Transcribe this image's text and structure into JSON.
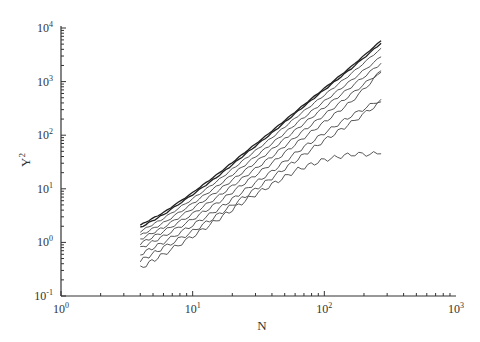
{
  "chart_data": {
    "type": "line",
    "title": "",
    "xlabel": "N",
    "ylabel": "Y^2",
    "xscale": "log",
    "yscale": "log",
    "xlim": [
      1,
      1000
    ],
    "ylim": [
      0.1,
      10000
    ],
    "grid": false,
    "legend": null,
    "x_ticks": [
      {
        "value": 1,
        "base": "10",
        "exp": "0"
      },
      {
        "value": 10,
        "base": "10",
        "exp": "1"
      },
      {
        "value": 100,
        "base": "10",
        "exp": "2"
      },
      {
        "value": 1000,
        "base": "10",
        "exp": "3"
      }
    ],
    "y_ticks": [
      {
        "value": 0.1,
        "base": "10",
        "exp": "-1"
      },
      {
        "value": 1,
        "base": "10",
        "exp": "0"
      },
      {
        "value": 10,
        "base": "10",
        "exp": "1"
      },
      {
        "value": 100,
        "base": "10",
        "exp": "2"
      },
      {
        "value": 1000,
        "base": "10",
        "exp": "3"
      },
      {
        "value": 10000,
        "base": "10",
        "exp": "4"
      }
    ],
    "x": [
      4,
      6,
      10,
      16,
      25,
      40,
      63,
      100,
      160,
      270
    ],
    "series": [
      {
        "name": "curve-1",
        "values": [
          2.1,
          3.6,
          8.5,
          20,
          48,
          120,
          300,
          750,
          1900,
          5800
        ]
      },
      {
        "name": "curve-2",
        "values": [
          1.9,
          3.3,
          7.8,
          18,
          44,
          110,
          280,
          700,
          1750,
          5200
        ]
      },
      {
        "name": "curve-3",
        "values": [
          1.6,
          2.8,
          6.5,
          15,
          36,
          90,
          230,
          560,
          1400,
          4200
        ]
      },
      {
        "name": "curve-4",
        "values": [
          1.35,
          2.3,
          5.3,
          12,
          28,
          70,
          175,
          430,
          1050,
          2900
        ]
      },
      {
        "name": "curve-5",
        "values": [
          1.15,
          1.9,
          4.3,
          9.6,
          22,
          54,
          135,
          330,
          800,
          2200
        ]
      },
      {
        "name": "curve-6",
        "values": [
          0.95,
          1.6,
          3.4,
          7.5,
          17,
          40,
          100,
          240,
          580,
          1600
        ]
      },
      {
        "name": "curve-7",
        "values": [
          0.78,
          1.3,
          2.7,
          5.8,
          13,
          30,
          74,
          175,
          420,
          1500
        ]
      },
      {
        "name": "curve-8",
        "values": [
          0.6,
          1.0,
          2.1,
          4.3,
          9.5,
          21,
          50,
          110,
          230,
          470
        ]
      },
      {
        "name": "curve-9",
        "values": [
          0.45,
          0.8,
          1.6,
          3.4,
          7.2,
          16,
          36,
          80,
          170,
          420
        ]
      },
      {
        "name": "curve-10",
        "values": [
          0.33,
          0.6,
          1.3,
          2.8,
          6.0,
          12,
          23,
          35,
          44,
          45
        ]
      }
    ]
  }
}
